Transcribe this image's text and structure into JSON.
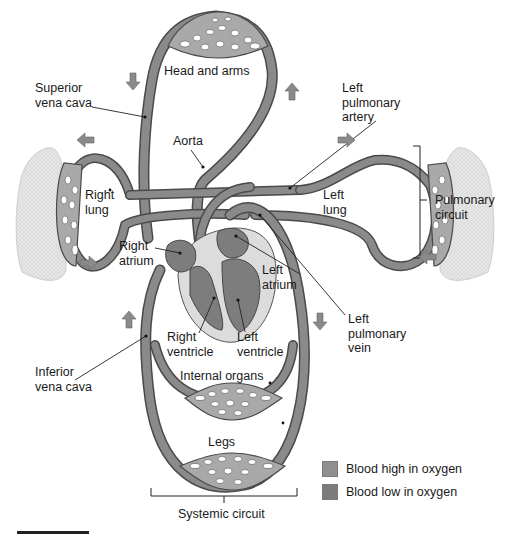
{
  "figure": {
    "labels": {
      "head_and_arms": "Head and arms",
      "superior_vena_cava": "Superior\nvena cava",
      "aorta": "Aorta",
      "left_pulmonary_artery": "Left\npulmonary\nartery",
      "right_lung": "Right\nlung",
      "left_lung": "Left\nlung",
      "pulmonary_circuit": "Pulmonary\ncircuit",
      "right_atrium": "Right\natrium",
      "left_atrium": "Left\natrium",
      "right_ventricle": "Right\nventricle",
      "left_ventricle": "Left\nventricle",
      "left_pulmonary_vein": "Left\npulmonary\nvein",
      "inferior_vena_cava": "Inferior\nvena cava",
      "internal_organs": "Internal organs",
      "legs": "Legs",
      "systemic_circuit": "Systemic circuit"
    },
    "legend": [
      {
        "label": "Blood high in oxygen",
        "color": "#8f8f8f"
      },
      {
        "label": "Blood low in oxygen",
        "color": "#7b7b7b"
      }
    ],
    "flow_arrows": [
      {
        "id": "head-down-left",
        "direction": "down"
      },
      {
        "id": "head-up-right",
        "direction": "up"
      },
      {
        "id": "lung-left-out",
        "direction": "left"
      },
      {
        "id": "lung-left-in",
        "direction": "right"
      },
      {
        "id": "lung-right-out",
        "direction": "right"
      },
      {
        "id": "lung-right-in",
        "direction": "left"
      },
      {
        "id": "body-up-left",
        "direction": "up"
      },
      {
        "id": "body-down-right",
        "direction": "down"
      }
    ],
    "colors": {
      "vessel": "#8a8a8a",
      "vessel_outline": "#4a4a4a",
      "capillary_bed": "#a9a9a9",
      "lung_tissue": "#e3e3e3",
      "heart_pericardium": "#dcdcdc",
      "heart_chamber": "#7d7d7d",
      "arrow": "#8a8a8a",
      "text": "#1a1a1a"
    }
  }
}
